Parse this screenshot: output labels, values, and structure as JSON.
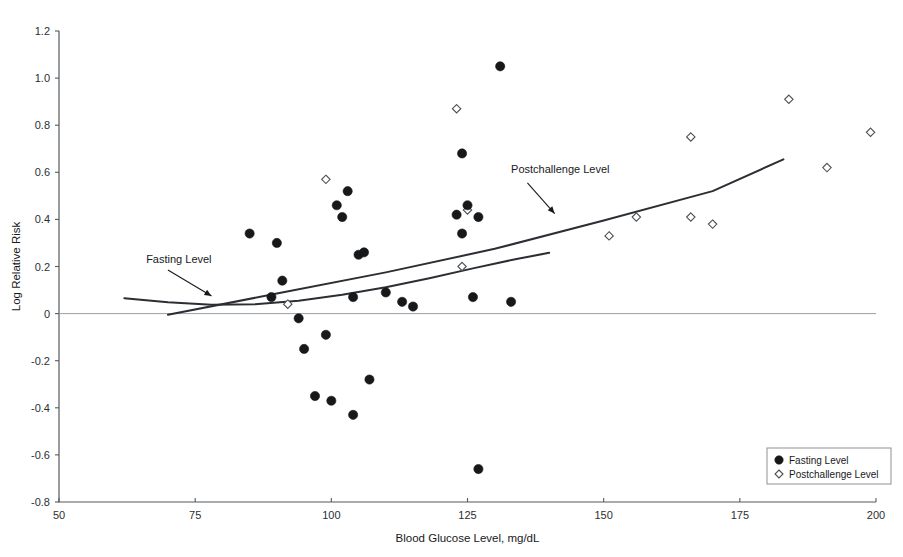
{
  "chart_data": {
    "type": "scatter",
    "title": "",
    "xlabel": "Blood Glucose Level, mg/dL",
    "ylabel": "Log Relative Risk",
    "xlim": [
      50,
      200
    ],
    "ylim": [
      -0.8,
      1.2
    ],
    "xticks": [
      50,
      75,
      100,
      125,
      150,
      175,
      200
    ],
    "yticks": [
      -0.8,
      -0.6,
      -0.4,
      -0.2,
      0,
      0.2,
      0.4,
      0.6,
      0.8,
      1.0,
      1.2
    ],
    "xtick_labels": [
      "50",
      "75",
      "100",
      "125",
      "150",
      "175",
      "200"
    ],
    "ytick_labels": [
      "-0.8",
      "-0.6",
      "-0.4",
      "-0.2",
      "0",
      "0.2",
      "0.4",
      "0.6",
      "0.8",
      "1.0",
      "1.2"
    ],
    "grid": false,
    "zero_reference_line": 0,
    "legend_position": "bottom-right",
    "series": [
      {
        "name": "Fasting Level",
        "marker": "filled-circle",
        "color": "#16181a",
        "points": [
          [
            85,
            0.34
          ],
          [
            90,
            0.3
          ],
          [
            89,
            0.07
          ],
          [
            91,
            0.14
          ],
          [
            94,
            -0.02
          ],
          [
            95,
            -0.15
          ],
          [
            97,
            -0.35
          ],
          [
            99,
            -0.09
          ],
          [
            100,
            -0.37
          ],
          [
            101,
            0.46
          ],
          [
            103,
            0.52
          ],
          [
            102,
            0.41
          ],
          [
            104,
            0.07
          ],
          [
            105,
            0.25
          ],
          [
            106,
            0.26
          ],
          [
            104,
            -0.43
          ],
          [
            107,
            -0.28
          ],
          [
            110,
            0.09
          ],
          [
            113,
            0.05
          ],
          [
            115,
            0.03
          ],
          [
            123,
            0.42
          ],
          [
            124,
            0.34
          ],
          [
            125,
            0.46
          ],
          [
            127,
            0.41
          ],
          [
            124,
            0.68
          ],
          [
            131,
            1.05
          ],
          [
            126,
            0.07
          ],
          [
            133,
            0.05
          ],
          [
            127,
            -0.66
          ]
        ]
      },
      {
        "name": "Postchallenge Level",
        "marker": "open-diamond",
        "color": "#ffffff",
        "points": [
          [
            92,
            0.04
          ],
          [
            99,
            0.57
          ],
          [
            123,
            0.87
          ],
          [
            125,
            0.44
          ],
          [
            124,
            0.2
          ],
          [
            151,
            0.33
          ],
          [
            156,
            0.41
          ],
          [
            166,
            0.75
          ],
          [
            166,
            0.41
          ],
          [
            170,
            0.38
          ],
          [
            184,
            0.91
          ],
          [
            191,
            0.62
          ],
          [
            199,
            0.77
          ]
        ]
      }
    ],
    "fit_curves": [
      {
        "name": "Fasting Level",
        "label": "Fasting Level",
        "points": [
          [
            62,
            0.065
          ],
          [
            70,
            0.048
          ],
          [
            78,
            0.038
          ],
          [
            86,
            0.04
          ],
          [
            94,
            0.055
          ],
          [
            102,
            0.08
          ],
          [
            110,
            0.112
          ],
          [
            118,
            0.15
          ],
          [
            126,
            0.192
          ],
          [
            134,
            0.232
          ],
          [
            140,
            0.258
          ]
        ]
      },
      {
        "name": "Postchallenge Level",
        "label": "Postchallenge Level",
        "points": [
          [
            70,
            -0.005
          ],
          [
            90,
            0.085
          ],
          [
            110,
            0.175
          ],
          [
            130,
            0.275
          ],
          [
            150,
            0.395
          ],
          [
            170,
            0.52
          ],
          [
            183,
            0.655
          ]
        ]
      }
    ],
    "annotations": [
      {
        "text": "Fasting Level",
        "text_x": 66,
        "text_y": 0.215,
        "arrow_from_x": 70,
        "arrow_from_y": 0.185,
        "arrow_to_x": 78,
        "arrow_to_y": 0.075
      },
      {
        "text": "Postchallenge Level",
        "text_x": 133,
        "text_y": 0.595,
        "arrow_from_x": 136,
        "arrow_from_y": 0.555,
        "arrow_to_x": 141,
        "arrow_to_y": 0.425
      }
    ]
  },
  "legend": {
    "entries": [
      {
        "label": "Fasting Level",
        "marker": "filled-circle"
      },
      {
        "label": "Postchallenge Level",
        "marker": "open-diamond"
      }
    ]
  },
  "colors": {
    "axis": "#555a5e",
    "zero_line": "#9aa0a4",
    "curve": "#2b2f33",
    "fasting_marker": "#16181a",
    "postchallenge_stroke": "#4a4f54",
    "background": "#ffffff"
  }
}
